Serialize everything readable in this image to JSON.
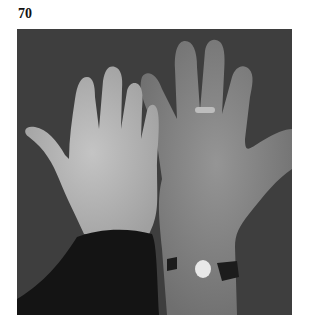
{
  "figure": {
    "label": "70",
    "image": {
      "description": "Grayscale photograph of two open palms side by side; left hand smaller and paler with dark sleeve, right hand larger and darker with a ring and a wristband",
      "background_color": "#3e3e3e",
      "left_hand_tone": "#b8b8b8",
      "right_hand_tone": "#8a8a8a",
      "sleeve_color": "#141414"
    }
  }
}
